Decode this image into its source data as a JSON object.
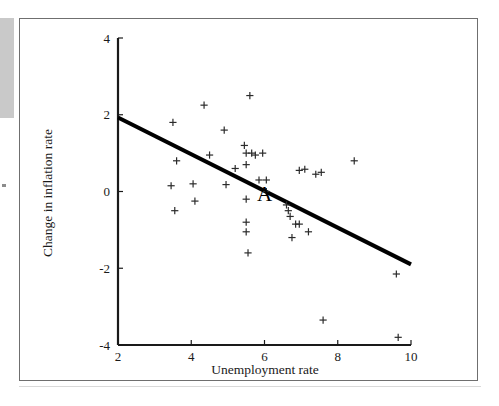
{
  "figure": {
    "annotation_label": "A",
    "axis_color": "#1a1a1a",
    "line_color": "#000000",
    "marker_color": "#2b2b2b",
    "background": "#ffffff"
  },
  "chart_data": {
    "type": "scatter",
    "title": "",
    "xlabel": "Unemployment rate",
    "ylabel": "Change in inflation rate",
    "xlim": [
      2,
      10
    ],
    "ylim": [
      -4,
      4
    ],
    "xticks": [
      2,
      4,
      6,
      8,
      10
    ],
    "yticks": [
      -4,
      -2,
      0,
      2,
      4
    ],
    "xtick_labels": [
      "2",
      "4",
      "6",
      "8",
      "10"
    ],
    "ytick_labels": [
      "-4",
      "-2",
      "0",
      "2",
      "4"
    ],
    "grid": false,
    "legend": false,
    "marker": "plus",
    "points": [
      {
        "x": 3.45,
        "y": 0.15
      },
      {
        "x": 3.5,
        "y": 1.8
      },
      {
        "x": 3.55,
        "y": -0.5
      },
      {
        "x": 3.6,
        "y": 0.8
      },
      {
        "x": 4.05,
        "y": 0.2
      },
      {
        "x": 4.1,
        "y": -0.25
      },
      {
        "x": 4.35,
        "y": 2.25
      },
      {
        "x": 4.5,
        "y": 0.95
      },
      {
        "x": 4.9,
        "y": 1.6
      },
      {
        "x": 4.95,
        "y": 0.18
      },
      {
        "x": 5.2,
        "y": 0.6
      },
      {
        "x": 5.45,
        "y": 1.2
      },
      {
        "x": 5.5,
        "y": 1.0
      },
      {
        "x": 5.5,
        "y": 0.7
      },
      {
        "x": 5.5,
        "y": -0.2
      },
      {
        "x": 5.5,
        "y": -0.8
      },
      {
        "x": 5.5,
        "y": -1.05
      },
      {
        "x": 5.55,
        "y": -1.6
      },
      {
        "x": 5.6,
        "y": 2.5
      },
      {
        "x": 5.65,
        "y": 1.0
      },
      {
        "x": 5.75,
        "y": 0.95
      },
      {
        "x": 5.85,
        "y": 0.3
      },
      {
        "x": 5.95,
        "y": 1.0
      },
      {
        "x": 6.05,
        "y": 0.3
      },
      {
        "x": 6.05,
        "y": 0.0
      },
      {
        "x": 6.6,
        "y": -0.35
      },
      {
        "x": 6.65,
        "y": -0.5
      },
      {
        "x": 6.7,
        "y": -0.65
      },
      {
        "x": 6.75,
        "y": -1.2
      },
      {
        "x": 6.85,
        "y": -0.85
      },
      {
        "x": 6.95,
        "y": -0.85
      },
      {
        "x": 6.95,
        "y": 0.55
      },
      {
        "x": 7.1,
        "y": 0.58
      },
      {
        "x": 7.2,
        "y": -1.05
      },
      {
        "x": 7.4,
        "y": 0.45
      },
      {
        "x": 7.55,
        "y": 0.5
      },
      {
        "x": 7.6,
        "y": -3.35
      },
      {
        "x": 8.45,
        "y": 0.8
      },
      {
        "x": 9.6,
        "y": -2.15
      },
      {
        "x": 9.65,
        "y": -3.8
      }
    ],
    "fit_line": {
      "x_start": 2,
      "y_start": 1.93,
      "x_end": 10,
      "y_end": -1.9
    },
    "annotations": [
      {
        "label": "A",
        "x": 6.0,
        "y": -0.05
      }
    ]
  }
}
